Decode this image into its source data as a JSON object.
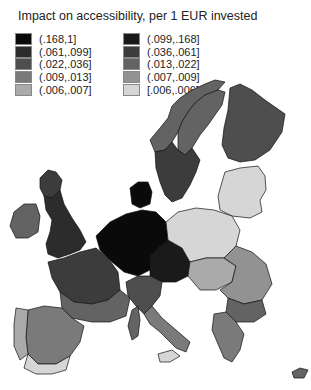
{
  "title": "Impact on accessibility, per 1 EUR invested",
  "legend": {
    "column1": [
      {
        "label": "(.168,1]",
        "color": "#0a0a0a"
      },
      {
        "label": "(.061,.099]",
        "color": "#2c2c2c"
      },
      {
        "label": "(.022,.036]",
        "color": "#4e4e4e"
      },
      {
        "label": "(.009,.013]",
        "color": "#7a7a7a"
      },
      {
        "label": "(.006,.007]",
        "color": "#aaaaaa"
      }
    ],
    "column2": [
      {
        "label": "(.099,.168]",
        "color": "#1a1a1a"
      },
      {
        "label": "(.036,.061]",
        "color": "#3c3c3c"
      },
      {
        "label": "(.013,.022]",
        "color": "#636363"
      },
      {
        "label": "(.007,.009]",
        "color": "#929292"
      },
      {
        "label": "[.006,.006]",
        "color": "#d6d6d6"
      }
    ]
  },
  "map": {
    "regions": [
      {
        "name": "norway",
        "class": "(.013,.022]"
      },
      {
        "name": "sweden-north",
        "class": "(.013,.022]"
      },
      {
        "name": "sweden-south",
        "class": "(.036,.061]"
      },
      {
        "name": "finland",
        "class": "(.022,.036]"
      },
      {
        "name": "baltics",
        "class": "[.006,.006]"
      },
      {
        "name": "uk",
        "class": "(.061,.099]"
      },
      {
        "name": "scotland",
        "class": "(.036,.061]"
      },
      {
        "name": "ireland",
        "class": "(.013,.022]"
      },
      {
        "name": "denmark",
        "class": "(.168,1]"
      },
      {
        "name": "benelux-germany",
        "class": "(.168,1]"
      },
      {
        "name": "austria-czech",
        "class": "(.099,.168]"
      },
      {
        "name": "poland",
        "class": "[.006,.006]"
      },
      {
        "name": "france-north",
        "class": "(.036,.061]"
      },
      {
        "name": "france-south",
        "class": "(.013,.022]"
      },
      {
        "name": "iberia",
        "class": "(.009,.013]"
      },
      {
        "name": "portugal",
        "class": "(.006,.007]"
      },
      {
        "name": "andalusia",
        "class": "[.006,.006]"
      },
      {
        "name": "italy-north",
        "class": "(.022,.036]"
      },
      {
        "name": "italy-south",
        "class": "(.009,.013]"
      },
      {
        "name": "sicily",
        "class": "[.006,.006]"
      },
      {
        "name": "sardinia-corsica",
        "class": "(.013,.022]"
      },
      {
        "name": "hungary-slovakia",
        "class": "(.006,.007]"
      },
      {
        "name": "romania",
        "class": "(.007,.009]"
      },
      {
        "name": "bulgaria",
        "class": "(.013,.022]"
      },
      {
        "name": "greece",
        "class": "(.009,.013]"
      },
      {
        "name": "cyprus",
        "class": "(.013,.022]"
      }
    ]
  }
}
